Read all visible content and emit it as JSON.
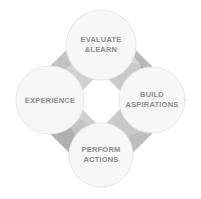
{
  "diagram": {
    "shape": "diamond",
    "center": {
      "name": "center-diamond",
      "fill": "#ffffff"
    },
    "colors": {
      "background": "#ffffff",
      "diamond_light": "#d3d3d3",
      "diamond_mid": "#c6c6c6",
      "diamond_dark": "#b4b4b4",
      "diamond_darker": "#a8a8a8",
      "circle_fill": "#f7f7f7",
      "circle_stroke": "#e2e2e2",
      "text": "#8d8d8d"
    },
    "nodes": [
      {
        "id": "evaluate-learn",
        "position": "top",
        "cx": 101,
        "cy": 45,
        "r": 35,
        "lines": [
          "EVALUATE",
          "&LEARN"
        ]
      },
      {
        "id": "build-aspirations",
        "position": "right",
        "cx": 152,
        "cy": 100,
        "r": 33,
        "lines": [
          "BUILD",
          "ASPIRATIONS"
        ]
      },
      {
        "id": "perform-actions",
        "position": "bottom",
        "cx": 101,
        "cy": 155,
        "r": 32,
        "lines": [
          "PERFORM",
          "ACTIONS"
        ]
      },
      {
        "id": "experience",
        "position": "left",
        "cx": 50,
        "cy": 100,
        "r": 34,
        "lines": [
          "EXPERIENCE"
        ]
      }
    ]
  }
}
